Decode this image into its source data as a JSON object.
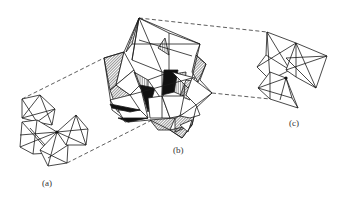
{
  "figure": {
    "panels": [
      {
        "id": "a",
        "label": "(a)",
        "description": "small cluster of octahedra sharing a central vertex"
      },
      {
        "id": "b",
        "label": "(b)",
        "description": "large assembled polyhedral cluster with hatched and solid shaded faces"
      },
      {
        "id": "c",
        "label": "(c)",
        "description": "cluster of octahedra sharing a central vertex"
      }
    ],
    "connectors": {
      "style": "dashed",
      "count": 4,
      "description": "dashed lines linking (a) and (c) outlines to (b)"
    },
    "colors": {
      "line": "#1a1a1a",
      "dash": "#333333",
      "background": "#ffffff",
      "solid_fill": "#111111"
    }
  }
}
